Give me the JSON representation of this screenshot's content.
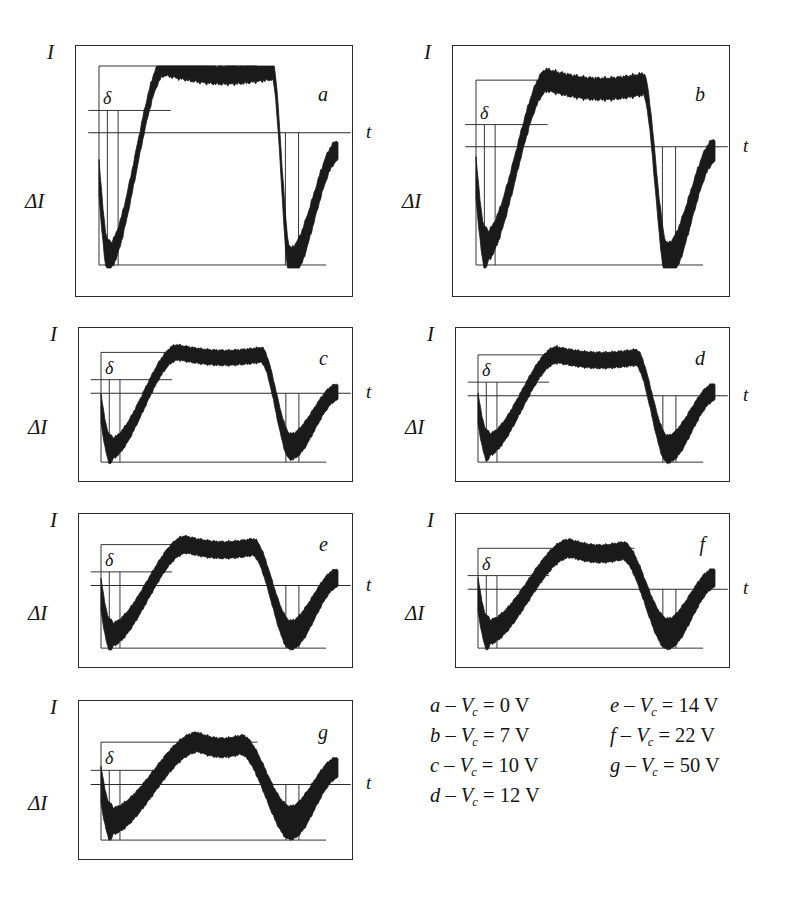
{
  "figure": {
    "kind": "oscillogram-panel-grid",
    "panel_count": 7,
    "background": "#ffffff",
    "trace_color": "#1a1a1a",
    "frame_color": "#2b2b2b",
    "axis_labels": {
      "vertical": "I",
      "vertical_delta": "ΔI",
      "horizontal": "t",
      "small_delta": "δ"
    }
  },
  "panels": [
    {
      "id": "a",
      "letter": "a",
      "x": 75,
      "y": 45,
      "w": 278,
      "h": 252,
      "t_label": "t",
      "label_I": "I",
      "label_dI": "ΔI",
      "label_delta": "δ"
    },
    {
      "id": "b",
      "letter": "b",
      "x": 452,
      "y": 45,
      "w": 278,
      "h": 252,
      "t_label": "t",
      "label_I": "I",
      "label_dI": "ΔI",
      "label_delta": "δ"
    },
    {
      "id": "c",
      "letter": "c",
      "x": 78,
      "y": 327,
      "w": 275,
      "h": 155,
      "t_label": "t",
      "label_I": "I",
      "label_dI": "ΔI",
      "label_delta": "δ"
    },
    {
      "id": "d",
      "letter": "d",
      "x": 455,
      "y": 327,
      "w": 275,
      "h": 155,
      "t_label": "t",
      "label_I": "I",
      "label_dI": "ΔI",
      "label_delta": "δ"
    },
    {
      "id": "e",
      "letter": "e",
      "x": 78,
      "y": 513,
      "w": 275,
      "h": 155,
      "t_label": "t",
      "label_I": "I",
      "label_dI": "ΔI",
      "label_delta": "δ"
    },
    {
      "id": "f",
      "letter": "f",
      "x": 455,
      "y": 513,
      "w": 275,
      "h": 155,
      "t_label": "t",
      "label_I": "I",
      "label_dI": "ΔI",
      "label_delta": "δ"
    },
    {
      "id": "g",
      "letter": "g",
      "x": 78,
      "y": 700,
      "w": 275,
      "h": 160,
      "t_label": "t",
      "label_I": "I",
      "label_dI": "ΔI",
      "label_delta": "δ"
    }
  ],
  "legend": {
    "columns": [
      {
        "rows": [
          {
            "letter": "a",
            "dash": "–",
            "symbol": "V",
            "subscript": "c",
            "eq": "=",
            "value": "0",
            "unit": "V"
          },
          {
            "letter": "b",
            "dash": "–",
            "symbol": "V",
            "subscript": "c",
            "eq": "=",
            "value": "7",
            "unit": "V"
          },
          {
            "letter": "c",
            "dash": "–",
            "symbol": "V",
            "subscript": "c",
            "eq": "=",
            "value": "10",
            "unit": "V"
          },
          {
            "letter": "d",
            "dash": "–",
            "symbol": "V",
            "subscript": "c",
            "eq": "=",
            "value": "12",
            "unit": "V"
          }
        ]
      },
      {
        "rows": [
          {
            "letter": "e",
            "dash": "–",
            "symbol": "V",
            "subscript": "c",
            "eq": "=",
            "value": "14",
            "unit": "V"
          },
          {
            "letter": "f",
            "dash": "–",
            "symbol": "V",
            "subscript": "c",
            "eq": "=",
            "value": "22",
            "unit": "V"
          },
          {
            "letter": "g",
            "dash": "–",
            "symbol": "V",
            "subscript": "c",
            "eq": "=",
            "value": "50",
            "unit": "V"
          }
        ]
      }
    ]
  },
  "chart_data": {
    "type": "line",
    "title": "",
    "xlabel": "t",
    "ylabel": "I / ΔI",
    "grid": false,
    "legend_position": "below-right",
    "series": [
      {
        "name": "a",
        "param": "V_c = 0 V",
        "peak_rel": 1.0,
        "dip1_rel": 0.05,
        "dip2_rel": 0.02,
        "band_width_rel": 0.13,
        "plateau_width_rel": 0.45
      },
      {
        "name": "b",
        "param": "V_c = 7 V",
        "peak_rel": 0.93,
        "dip1_rel": 0.1,
        "dip2_rel": 0.03,
        "band_width_rel": 0.15,
        "plateau_width_rel": 0.4
      },
      {
        "name": "c",
        "param": "V_c = 10 V",
        "peak_rel": 0.9,
        "dip1_rel": 0.12,
        "dip2_rel": 0.14,
        "band_width_rel": 0.17,
        "plateau_width_rel": 0.35
      },
      {
        "name": "d",
        "param": "V_c = 12 V",
        "peak_rel": 0.88,
        "dip1_rel": 0.15,
        "dip2_rel": 0.12,
        "band_width_rel": 0.18,
        "plateau_width_rel": 0.33
      },
      {
        "name": "e",
        "param": "V_c = 14 V",
        "peak_rel": 0.85,
        "dip1_rel": 0.12,
        "dip2_rel": 0.12,
        "band_width_rel": 0.19,
        "plateau_width_rel": 0.28
      },
      {
        "name": "f",
        "param": "V_c = 22 V",
        "peak_rel": 0.82,
        "dip1_rel": 0.14,
        "dip2_rel": 0.13,
        "band_width_rel": 0.2,
        "plateau_width_rel": 0.22
      },
      {
        "name": "g",
        "param": "V_c = 50 V",
        "peak_rel": 0.78,
        "dip1_rel": 0.16,
        "dip2_rel": 0.15,
        "band_width_rel": 0.21,
        "plateau_width_rel": 0.18
      }
    ],
    "reference_lines": [
      "I",
      "δ",
      "ΔI baseline"
    ]
  }
}
